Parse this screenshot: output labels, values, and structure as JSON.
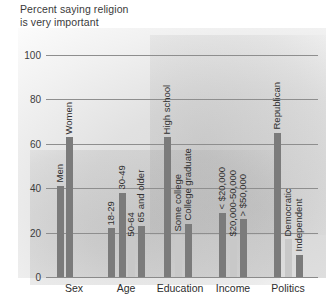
{
  "chart_data": {
    "type": "bar",
    "title": "Percent saying religion\nis very important",
    "title_line1": "Percent saying religion",
    "title_line2": "is very important",
    "xlabel": "",
    "ylabel": "Percent",
    "ylim": [
      0,
      100
    ],
    "yticks": [
      0,
      20,
      40,
      60,
      80,
      100
    ],
    "ytick_labels": [
      "0",
      "20",
      "40",
      "60",
      "80",
      "100"
    ],
    "grid": true,
    "legend": "none",
    "groups": [
      {
        "name": "Sex",
        "categories": [
          "Men",
          "Women"
        ],
        "values": [
          41,
          63
        ],
        "shades": [
          "dark",
          "dark"
        ]
      },
      {
        "name": "Age",
        "categories": [
          "18-29",
          "30-49",
          "50-64",
          "65 and older"
        ],
        "values": [
          22,
          38,
          17,
          23
        ],
        "shades": [
          "dark",
          "dark",
          "light",
          "dark"
        ]
      },
      {
        "name": "Education",
        "categories": [
          "High school",
          "Some college",
          "College graduate"
        ],
        "values": [
          63,
          19,
          24
        ],
        "shades": [
          "dark",
          "light",
          "dark"
        ]
      },
      {
        "name": "Income",
        "categories": [
          "< $20,000",
          "$20,000-50,000",
          "> $50,000"
        ],
        "values": [
          29,
          17,
          26
        ],
        "shades": [
          "dark",
          "light",
          "dark"
        ]
      },
      {
        "name": "Politics",
        "categories": [
          "Republican",
          "Democratic",
          "Independent"
        ],
        "values": [
          65,
          17,
          10
        ],
        "shades": [
          "dark",
          "light",
          "dark"
        ]
      }
    ],
    "categories": [
      "Men",
      "Women",
      "18-29",
      "30-49",
      "50-64",
      "65 and older",
      "High school",
      "Some college",
      "College graduate",
      "< $20,000",
      "$20,000-50,000",
      "> $50,000",
      "Republican",
      "Democratic",
      "Independent"
    ],
    "values": [
      41,
      63,
      22,
      38,
      17,
      23,
      63,
      19,
      24,
      29,
      17,
      26,
      65,
      17,
      10
    ],
    "colors": {
      "dark_bar": "#7b7b7b",
      "light_bar": "#c8c8c8",
      "gridline": "#8e8e8e",
      "text": "#2f2f2f"
    }
  }
}
